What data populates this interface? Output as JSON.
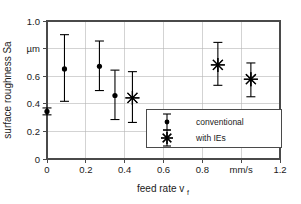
{
  "chart_data": {
    "type": "scatter",
    "title": "",
    "xlabel": "feed rate v",
    "xlabel_sub": "f",
    "ylabel": "surface roughness Sa",
    "xlim": [
      0,
      1.2
    ],
    "ylim": [
      0,
      1.0
    ],
    "xticks": [
      "0",
      "0.2",
      "0.4",
      "0.6",
      "0.8",
      "mm/s",
      "1.2"
    ],
    "xtick_values": [
      0,
      0.2,
      0.4,
      0.6,
      0.8,
      1.0,
      1.2
    ],
    "yticks": [
      "0",
      "0.2",
      "0.4",
      "0.6",
      "µm",
      "1.0"
    ],
    "ytick_values": [
      0,
      0.2,
      0.4,
      0.6,
      0.8,
      1.0
    ],
    "x_unit": "mm/s",
    "y_unit": "µm",
    "grid": true,
    "legend_position": "lower right",
    "series": [
      {
        "name": "conventional",
        "marker": "dot",
        "color": "#000000",
        "points": [
          {
            "x": 0.0,
            "y": 0.345,
            "err_low": 0.025,
            "err_high": 0.025
          },
          {
            "x": 0.09,
            "y": 0.653,
            "err_low": 0.235,
            "err_high": 0.248
          },
          {
            "x": 0.27,
            "y": 0.672,
            "err_high": 0.183,
            "err_low": 0.176
          },
          {
            "x": 0.35,
            "y": 0.46,
            "err_high": 0.184,
            "err_low": 0.174
          }
        ]
      },
      {
        "name": "with IEs",
        "marker": "star",
        "color": "#000000",
        "points": [
          {
            "x": 0.44,
            "y": 0.443,
            "err_high": 0.19,
            "err_low": 0.178
          },
          {
            "x": 0.88,
            "y": 0.682,
            "err_high": 0.163,
            "err_low": 0.148
          },
          {
            "x": 1.05,
            "y": 0.578,
            "err_high": 0.118,
            "err_low": 0.127
          }
        ]
      }
    ]
  },
  "legend": {
    "entries": [
      {
        "label": "conventional",
        "marker": "dot"
      },
      {
        "label": "with IEs",
        "marker": "star"
      }
    ]
  }
}
